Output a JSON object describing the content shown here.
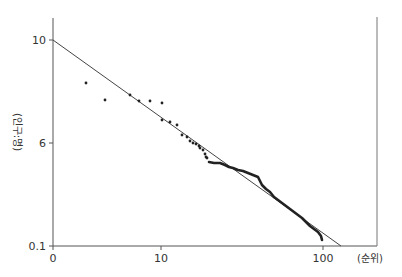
{
  "chart_data": {
    "type": "scatter",
    "title": "",
    "xlabel": "(순위)",
    "ylabel": "(인구:명)",
    "x_scale": "log",
    "y_scale": "log",
    "x_ticks": [
      {
        "label": "0",
        "px": 53
      },
      {
        "label": "10",
        "px": 161
      },
      {
        "label": "100",
        "px": 323
      }
    ],
    "y_ticks": [
      {
        "label": "10",
        "px": 40
      },
      {
        "label": "6",
        "px": 143
      },
      {
        "label": "0.1",
        "px": 246
      }
    ],
    "grid": false,
    "legend": null,
    "regression_line": {
      "x1": 53,
      "y1": 40,
      "x2": 341,
      "y2": 246
    },
    "scatter_points_px": [
      [
        86,
        83
      ],
      [
        105,
        100
      ],
      [
        130,
        95
      ],
      [
        139,
        101
      ],
      [
        150,
        101
      ],
      [
        162,
        103
      ],
      [
        162,
        120
      ],
      [
        170,
        122
      ],
      [
        177,
        125
      ],
      [
        182,
        135
      ],
      [
        187,
        137
      ],
      [
        190,
        141
      ],
      [
        193,
        143
      ],
      [
        196,
        144
      ],
      [
        199,
        146
      ],
      [
        200,
        148
      ],
      [
        203,
        150
      ],
      [
        205,
        154
      ],
      [
        206,
        157
      ],
      [
        207,
        158
      ]
    ],
    "dense_curve_px": [
      [
        209,
        162
      ],
      [
        214,
        163
      ],
      [
        220,
        163
      ],
      [
        225,
        165
      ],
      [
        229,
        167
      ],
      [
        233,
        168
      ],
      [
        238,
        170
      ],
      [
        243,
        171
      ],
      [
        248,
        173
      ],
      [
        253,
        175
      ],
      [
        258,
        177
      ],
      [
        262,
        185
      ],
      [
        266,
        189
      ],
      [
        270,
        192
      ],
      [
        274,
        197
      ],
      [
        278,
        200
      ],
      [
        282,
        203
      ],
      [
        286,
        206
      ],
      [
        290,
        209
      ],
      [
        294,
        212
      ],
      [
        298,
        215
      ],
      [
        302,
        218
      ],
      [
        306,
        222
      ],
      [
        310,
        226
      ],
      [
        314,
        229
      ],
      [
        318,
        232
      ],
      [
        321,
        236
      ],
      [
        322,
        240
      ]
    ]
  },
  "axes": {
    "x_title": "(순위)",
    "y_title": "(인구:명)",
    "y_tick_labels": [
      "10",
      "6",
      "0.1"
    ],
    "x_tick_labels": [
      "0",
      "10",
      "100"
    ]
  },
  "colors": {
    "axis": "#555555",
    "line": "#444444",
    "points": "#222222",
    "text": "#333333"
  }
}
